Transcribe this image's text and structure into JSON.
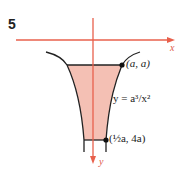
{
  "figure": {
    "number": "5",
    "x_axis_label": "x",
    "y_axis_label": "y",
    "point_top_label": "(a, a)",
    "curve_label": "y = a³/x²",
    "point_bottom_label": "(½a, 4a)"
  },
  "colors": {
    "axis": "#e8604c",
    "fill": "#f4c0b4",
    "curve": "#222222"
  }
}
